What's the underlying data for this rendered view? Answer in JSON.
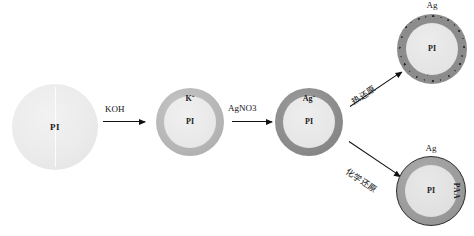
{
  "diagram": {
    "stages": [
      {
        "id": "pi-sphere",
        "core_label": "PI",
        "shell_label": "",
        "top_label": ""
      },
      {
        "id": "k-shell",
        "core_label": "PI",
        "shell_label": "K",
        "shell_charge": "+",
        "top_label": ""
      },
      {
        "id": "ag-ion-shell",
        "core_label": "PI",
        "shell_label": "Ag",
        "shell_charge": "+",
        "top_label": ""
      },
      {
        "id": "ag-granular-shell",
        "core_label": "PI",
        "shell_label": "",
        "top_label": "Ag"
      },
      {
        "id": "ag-paa-shell",
        "core_label": "PI",
        "shell_label": "PAA",
        "top_label": "Ag"
      }
    ],
    "arrows": [
      {
        "id": "koh",
        "label": "KOH",
        "label_sub": "",
        "direction": "right"
      },
      {
        "id": "agno3",
        "label": "AgNO",
        "label_sub": "3",
        "direction": "right"
      },
      {
        "id": "thermal-reduction",
        "label": "热还原",
        "direction": "up-right"
      },
      {
        "id": "chemical-reduction",
        "label": "化学还原",
        "direction": "down-right"
      }
    ],
    "colors": {
      "pi_core": "#ebebeb",
      "k_shell": "#b6b6b6",
      "ag_ion_shell": "#8b8b8b",
      "ag_particle": "#2f2f2f",
      "ag_paa_shell": "#9b9b9b",
      "arrow": "#111111",
      "text": "#1a1a1a",
      "background": "#ffffff"
    }
  }
}
